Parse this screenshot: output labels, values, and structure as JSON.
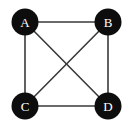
{
  "figure": {
    "background_color": "#ffffff",
    "width": 134,
    "height": 127
  },
  "style": {
    "node_fill": "#0d0d0d",
    "node_label_color": "#ffffff",
    "edge_color": "#3a3a3a",
    "edge_width": 1.6,
    "node_radius": 13.5
  },
  "graph": {
    "nodes": [
      {
        "id": "A",
        "label": "A",
        "cx": 25,
        "cy": 22,
        "r": 13.5
      },
      {
        "id": "B",
        "label": "B",
        "cx": 108,
        "cy": 22,
        "r": 13.5
      },
      {
        "id": "C",
        "label": "C",
        "cx": 25,
        "cy": 106,
        "r": 13.5
      },
      {
        "id": "D",
        "label": "D",
        "cx": 108,
        "cy": 106,
        "r": 13.5
      }
    ],
    "edges": [
      {
        "id": "A-B",
        "from": "A",
        "to": "B",
        "x1": 25,
        "y1": 22,
        "x2": 108,
        "y2": 22
      },
      {
        "id": "A-C",
        "from": "A",
        "to": "C",
        "x1": 25,
        "y1": 22,
        "x2": 25,
        "y2": 106
      },
      {
        "id": "B-D",
        "from": "B",
        "to": "D",
        "x1": 108,
        "y1": 22,
        "x2": 108,
        "y2": 106
      },
      {
        "id": "C-D",
        "from": "C",
        "to": "D",
        "x1": 25,
        "y1": 106,
        "x2": 108,
        "y2": 106
      },
      {
        "id": "A-D",
        "from": "A",
        "to": "D",
        "x1": 25,
        "y1": 22,
        "x2": 108,
        "y2": 106
      },
      {
        "id": "B-C",
        "from": "B",
        "to": "C",
        "x1": 108,
        "y1": 22,
        "x2": 25,
        "y2": 106
      }
    ]
  }
}
